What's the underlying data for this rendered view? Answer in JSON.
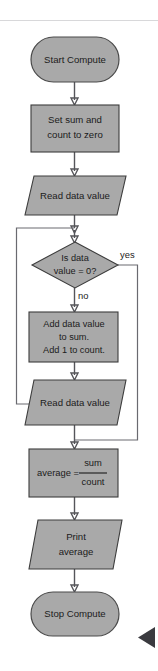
{
  "diagram": {
    "colors": {
      "shape_fill": "#a9a9a9",
      "shape_stroke": "#3c3c3c",
      "connector": "#55555a",
      "text": "#1b1b1b",
      "background": "#ffffff",
      "cursor": "#3a3a3f"
    },
    "nodes": {
      "start": {
        "label": "Start Compute",
        "shape": "terminator"
      },
      "init": {
        "line1": "Set sum and",
        "line2": "count to zero",
        "shape": "process"
      },
      "read_first": {
        "label": "Read data value",
        "shape": "input-output"
      },
      "decision": {
        "line1": "Is data",
        "line2": "value = 0?",
        "shape": "decision"
      },
      "accumulate": {
        "line1": "Add data value",
        "line2": "to sum.",
        "line3": "Add 1 to count.",
        "shape": "process"
      },
      "read_next": {
        "label": "Read data value",
        "shape": "input-output"
      },
      "average": {
        "lhs": "average =",
        "numerator": "sum",
        "denominator": "count",
        "shape": "process"
      },
      "print": {
        "line1": "Print",
        "line2": "average",
        "shape": "input-output"
      },
      "stop": {
        "label": "Stop Compute",
        "shape": "terminator"
      }
    },
    "branches": {
      "yes": "yes",
      "no": "no"
    },
    "cursor": {
      "name": "play-cursor-marker"
    }
  }
}
